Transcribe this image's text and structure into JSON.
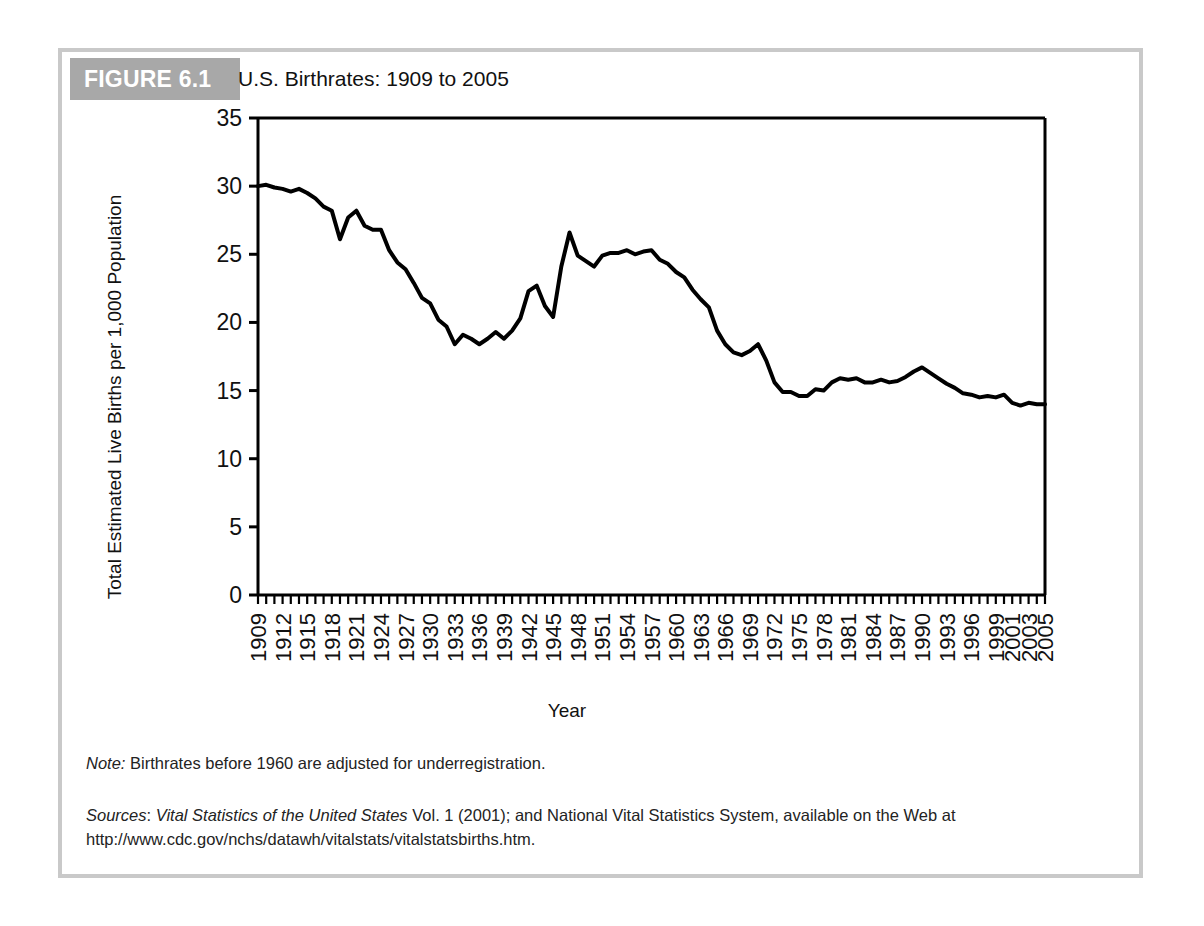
{
  "figure": {
    "tag": "FIGURE 6.1",
    "title": "U.S. Birthrates: 1909 to 2005",
    "note_label": "Note:",
    "note_text": " Birthrates before 1960 are adjusted for underregistration.",
    "sources_label": "Sources",
    "sources_sep": ": ",
    "sources_italic": "Vital Statistics of the United States",
    "sources_text": " Vol. 1 (2001); and National Vital Statistics System, available on the Web at http://www.cdc.gov/nchs/datawh/vitalstats/vitalstatsbirths.htm."
  },
  "chart_data": {
    "type": "line",
    "title": "U.S. Birthrates: 1909 to 2005",
    "xlabel": "Year",
    "ylabel": "Total Estimated Live Births per 1,000 Population",
    "xlim": [
      1909,
      2005
    ],
    "ylim": [
      0,
      35
    ],
    "yticks": [
      0,
      5,
      10,
      15,
      20,
      25,
      30,
      35
    ],
    "xtick_labels": [
      "1909",
      "1912",
      "1915",
      "1918",
      "1921",
      "1924",
      "1927",
      "1930",
      "1933",
      "1936",
      "1939",
      "1942",
      "1945",
      "1948",
      "1951",
      "1954",
      "1957",
      "1960",
      "1963",
      "1966",
      "1969",
      "1972",
      "1975",
      "1978",
      "1981",
      "1984",
      "1987",
      "1990",
      "1993",
      "1996",
      "1999",
      "2001",
      "2003",
      "2005"
    ],
    "xtick_years": [
      1909,
      1912,
      1915,
      1918,
      1921,
      1924,
      1927,
      1930,
      1933,
      1936,
      1939,
      1942,
      1945,
      1948,
      1951,
      1954,
      1957,
      1960,
      1963,
      1966,
      1969,
      1972,
      1975,
      1978,
      1981,
      1984,
      1987,
      1990,
      1993,
      1996,
      1999,
      2001,
      2003,
      2005
    ],
    "minor_tick_step": 1,
    "grid": false,
    "legend": false,
    "line_color": "#000000",
    "line_width": 4,
    "series": [
      {
        "name": "U.S. birthrate",
        "x": [
          1909,
          1910,
          1911,
          1912,
          1913,
          1914,
          1915,
          1916,
          1917,
          1918,
          1919,
          1920,
          1921,
          1922,
          1923,
          1924,
          1925,
          1926,
          1927,
          1928,
          1929,
          1930,
          1931,
          1932,
          1933,
          1934,
          1935,
          1936,
          1937,
          1938,
          1939,
          1940,
          1941,
          1942,
          1943,
          1944,
          1945,
          1946,
          1947,
          1948,
          1949,
          1950,
          1951,
          1952,
          1953,
          1954,
          1955,
          1956,
          1957,
          1958,
          1959,
          1960,
          1961,
          1962,
          1963,
          1964,
          1965,
          1966,
          1967,
          1968,
          1969,
          1970,
          1971,
          1972,
          1973,
          1974,
          1975,
          1976,
          1977,
          1978,
          1979,
          1980,
          1981,
          1982,
          1983,
          1984,
          1985,
          1986,
          1987,
          1988,
          1989,
          1990,
          1991,
          1992,
          1993,
          1994,
          1995,
          1996,
          1997,
          1998,
          1999,
          2000,
          2001,
          2002,
          2003,
          2004,
          2005
        ],
        "values": [
          30.0,
          30.1,
          29.9,
          29.8,
          29.6,
          29.8,
          29.5,
          29.1,
          28.5,
          28.2,
          26.1,
          27.7,
          28.2,
          27.1,
          26.8,
          26.8,
          25.3,
          24.4,
          23.9,
          22.9,
          21.8,
          21.4,
          20.2,
          19.7,
          18.4,
          19.1,
          18.8,
          18.4,
          18.8,
          19.3,
          18.8,
          19.4,
          20.3,
          22.3,
          22.7,
          21.2,
          20.4,
          24.1,
          26.6,
          24.9,
          24.5,
          24.1,
          24.9,
          25.1,
          25.1,
          25.3,
          25.0,
          25.2,
          25.3,
          24.6,
          24.3,
          23.7,
          23.3,
          22.4,
          21.7,
          21.1,
          19.4,
          18.4,
          17.8,
          17.6,
          17.9,
          18.4,
          17.2,
          15.6,
          14.9,
          14.9,
          14.6,
          14.6,
          15.1,
          15.0,
          15.6,
          15.9,
          15.8,
          15.9,
          15.6,
          15.6,
          15.8,
          15.6,
          15.7,
          16.0,
          16.4,
          16.7,
          16.3,
          15.9,
          15.5,
          15.2,
          14.8,
          14.7,
          14.5,
          14.6,
          14.5,
          14.7,
          14.1,
          13.9,
          14.1,
          14.0,
          14.0
        ]
      }
    ]
  }
}
